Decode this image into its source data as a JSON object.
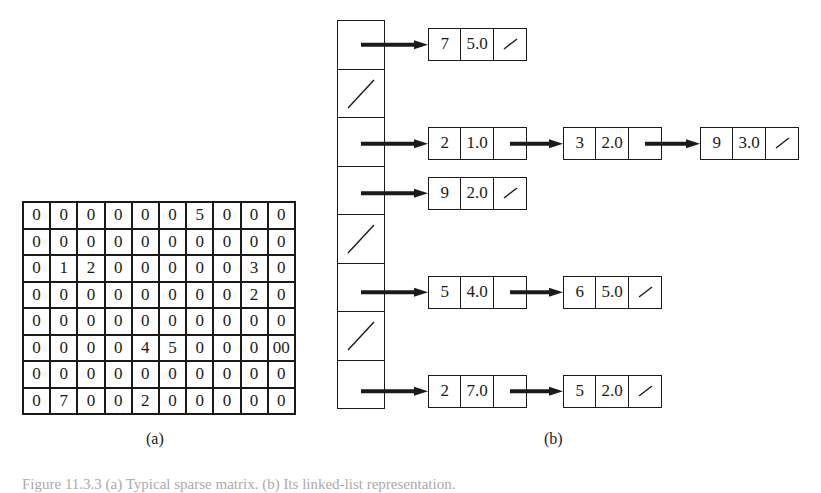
{
  "figure": {
    "label_a": "(a)",
    "label_b": "(b)",
    "caption": "Figure 11.3.3  (a) Typical sparse matrix. (b) Its linked-list representation."
  },
  "matrix": {
    "rows": [
      [
        "0",
        "0",
        "0",
        "0",
        "0",
        "0",
        "5",
        "0",
        "0",
        "0"
      ],
      [
        "0",
        "0",
        "0",
        "0",
        "0",
        "0",
        "0",
        "0",
        "0",
        "0"
      ],
      [
        "0",
        "1",
        "2",
        "0",
        "0",
        "0",
        "0",
        "0",
        "3",
        "0"
      ],
      [
        "0",
        "0",
        "0",
        "0",
        "0",
        "0",
        "0",
        "0",
        "2",
        "0"
      ],
      [
        "0",
        "0",
        "0",
        "0",
        "0",
        "0",
        "0",
        "0",
        "0",
        "0"
      ],
      [
        "0",
        "0",
        "0",
        "0",
        "4",
        "5",
        "0",
        "0",
        "0",
        "00"
      ],
      [
        "0",
        "0",
        "0",
        "0",
        "0",
        "0",
        "0",
        "0",
        "0",
        "0"
      ],
      [
        "0",
        "7",
        "0",
        "0",
        "2",
        "0",
        "0",
        "0",
        "0",
        "0"
      ]
    ]
  },
  "linked_list": {
    "null_symbol": "slash-icon",
    "rows": [
      {
        "nodes": [
          {
            "index": "7",
            "value": "5.0"
          }
        ]
      },
      {
        "nodes": []
      },
      {
        "nodes": [
          {
            "index": "2",
            "value": "1.0"
          },
          {
            "index": "3",
            "value": "2.0"
          },
          {
            "index": "9",
            "value": "3.0"
          }
        ]
      },
      {
        "nodes": [
          {
            "index": "9",
            "value": "2.0"
          }
        ]
      },
      {
        "nodes": []
      },
      {
        "nodes": [
          {
            "index": "5",
            "value": "4.0"
          },
          {
            "index": "6",
            "value": "5.0"
          }
        ]
      },
      {
        "nodes": []
      },
      {
        "nodes": [
          {
            "index": "2",
            "value": "7.0"
          },
          {
            "index": "5",
            "value": "2.0"
          }
        ]
      }
    ]
  },
  "colors": {
    "ink": "#1a1a1a",
    "background": "#ffffff"
  }
}
